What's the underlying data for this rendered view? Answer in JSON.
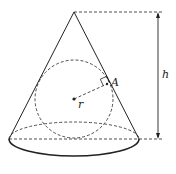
{
  "diagram": {
    "labels": {
      "height": "h",
      "radius": "r",
      "tangent_point": "A"
    },
    "colors": {
      "stroke": "#222222",
      "background": "#ffffff"
    },
    "geometry": {
      "apex": [
        74,
        12
      ],
      "base_center": [
        74,
        139
      ],
      "base_rx": 65,
      "base_ry": 33,
      "sphere_center": [
        74,
        99
      ],
      "sphere_radius": 39,
      "tangent_point": [
        107,
        84
      ],
      "height_arrow_x": 158
    }
  }
}
